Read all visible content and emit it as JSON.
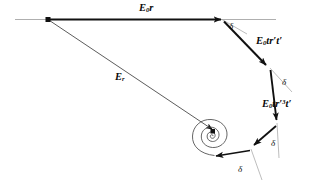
{
  "figure": {
    "type": "vector-phasor-diagram",
    "stroke_color": "#111111",
    "thin_stroke_color": "#8a8a8a",
    "background": "#ffffff",
    "canvas": {
      "width": 330,
      "height": 184
    }
  },
  "labels": {
    "e0r": {
      "base": "E",
      "sub": "0",
      "tail": "r"
    },
    "e0trt": {
      "base": "E",
      "sub": "0",
      "tail": "tr′t′"
    },
    "e0tr3t": {
      "base": "E",
      "sub": "0",
      "tail": "tr′",
      "exp": "3",
      "tail2": "t′"
    },
    "er": {
      "base": "E",
      "sub": "r"
    },
    "delta": "δ"
  },
  "deltas": [
    {
      "name": "delta-1",
      "symbol": "δ",
      "x": 229,
      "y": 24
    },
    {
      "name": "delta-2",
      "symbol": "δ",
      "x": 283,
      "y": 80
    },
    {
      "name": "delta-3",
      "symbol": "δ",
      "x": 274,
      "y": 142
    },
    {
      "name": "delta-4",
      "symbol": "δ",
      "x": 239,
      "y": 168
    }
  ],
  "vectors": [
    {
      "name": "E0r",
      "from": [
        48,
        19
      ],
      "to": [
        222,
        19
      ],
      "label": "E0r"
    },
    {
      "name": "E0trt",
      "from": [
        224,
        21
      ],
      "to": [
        268,
        67
      ],
      "label": "E0trt"
    },
    {
      "name": "E0tr3t",
      "from": [
        270,
        70
      ],
      "to": [
        277,
        122
      ],
      "label": "E0tr3t"
    },
    {
      "name": "E0tr5t",
      "from": [
        276,
        126
      ],
      "to": [
        252,
        147
      ],
      "label": ""
    },
    {
      "name": "E0tr7t",
      "from": [
        250,
        150
      ],
      "to": [
        213,
        156
      ],
      "label": ""
    },
    {
      "name": "Er",
      "from": [
        48,
        19
      ],
      "to": [
        214,
        131
      ],
      "label": "Er"
    }
  ],
  "axis_line": {
    "name": "reference-axis",
    "from": [
      15,
      19
    ],
    "to": [
      276,
      19
    ]
  },
  "spiral": {
    "name": "convergence-spiral",
    "center": [
      214,
      131
    ]
  }
}
